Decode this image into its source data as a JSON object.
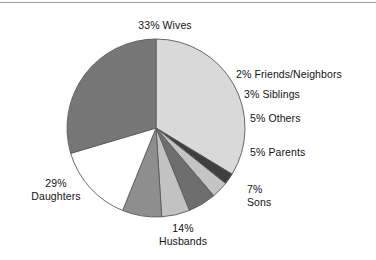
{
  "chart_data": {
    "type": "pie",
    "title": "",
    "subtitle": "",
    "xlabel": "",
    "ylabel": "",
    "legend_position": "none",
    "grid": false,
    "units": "percent",
    "total": 100,
    "start_angle_deg": 0,
    "direction": "clockwise",
    "categories": [
      "Wives",
      "Friends/Neighbors",
      "Siblings",
      "Others",
      "Parents",
      "Sons",
      "Husbands",
      "Daughters"
    ],
    "values": [
      33,
      2,
      3,
      5,
      5,
      7,
      14,
      29
    ],
    "slices": [
      {
        "label": "Wives",
        "value": 33,
        "value_text": "33%",
        "label_text": "33% Wives",
        "color": "#d9d9d9",
        "label_lines": [
          "33% Wives"
        ],
        "label_x": 165,
        "label_y": 19,
        "label_align": "center"
      },
      {
        "label": "Friends/Neighbors",
        "value": 2,
        "value_text": "2%",
        "label_text": "2% Friends/Neighbors",
        "color": "#3f3f3f",
        "label_lines": [
          "2% Friends/Neighbors"
        ],
        "label_x": 236,
        "label_y": 68,
        "label_align": "left"
      },
      {
        "label": "Siblings",
        "value": 3,
        "value_text": "3%",
        "label_text": "3% Siblings",
        "color": "#c4c4c4",
        "label_lines": [
          "3% Siblings"
        ],
        "label_x": 244,
        "label_y": 88,
        "label_align": "left"
      },
      {
        "label": "Others",
        "value": 5,
        "value_text": "5%",
        "label_text": "5% Others",
        "color": "#6e6e6e",
        "label_lines": [
          "5% Others"
        ],
        "label_x": 250,
        "label_y": 112,
        "label_align": "left"
      },
      {
        "label": "Parents",
        "value": 5,
        "value_text": "5%",
        "label_text": "5% Parents",
        "color": "#c2c2c2",
        "label_lines": [
          "5% Parents"
        ],
        "label_x": 250,
        "label_y": 146,
        "label_align": "left"
      },
      {
        "label": "Sons",
        "value": 7,
        "value_text": "7%",
        "label_text": "7% Sons",
        "color": "#8e8e8e",
        "label_lines": [
          "7%",
          "Sons"
        ],
        "label_x": 247,
        "label_y": 183,
        "label_align": "left"
      },
      {
        "label": "Husbands",
        "value": 14,
        "value_text": "14%",
        "label_text": "14% Husbands",
        "color": "#ffffff",
        "label_lines": [
          "14%",
          "Husbands"
        ],
        "label_x": 183,
        "label_y": 222,
        "label_align": "center"
      },
      {
        "label": "Daughters",
        "value": 29,
        "value_text": "29%",
        "label_text": "29% Daughters",
        "color": "#777777",
        "label_lines": [
          "29%",
          "Daughters"
        ],
        "label_x": 56,
        "label_y": 177,
        "label_align": "center"
      }
    ],
    "geometry": {
      "center_x": 156,
      "center_y": 128,
      "radius": 89
    },
    "colors": {
      "outline": "#5a5a5a",
      "background": "#ffffff",
      "text": "#121212",
      "top_rule": "#9a9a9a"
    }
  }
}
